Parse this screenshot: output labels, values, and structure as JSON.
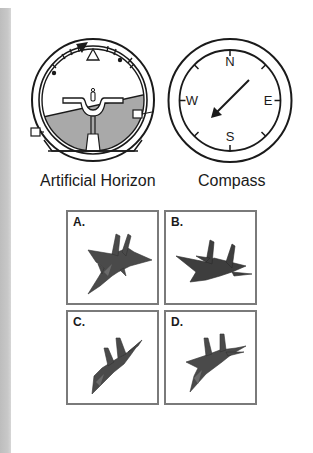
{
  "instruments": {
    "artificial_horizon": {
      "label": "Artificial Horizon",
      "icon": "attitude-indicator-icon",
      "state": "banked-left-level-pitch"
    },
    "compass": {
      "label": "Compass",
      "icon": "compass-icon",
      "cardinals": [
        "N",
        "E",
        "S",
        "W"
      ],
      "needle_heading": "southwest"
    }
  },
  "options": [
    {
      "label": "A.",
      "icon": "fighter-jet-icon"
    },
    {
      "label": "B.",
      "icon": "fighter-jet-icon"
    },
    {
      "label": "C.",
      "icon": "fighter-jet-icon"
    },
    {
      "label": "D.",
      "icon": "fighter-jet-icon"
    }
  ],
  "colors": {
    "ink": "#1a1a1a",
    "ground": "#a9a9a9",
    "box_border": "#7a7a7a",
    "jet": "#4a4a4a",
    "gutter": "#c4c4c4"
  }
}
